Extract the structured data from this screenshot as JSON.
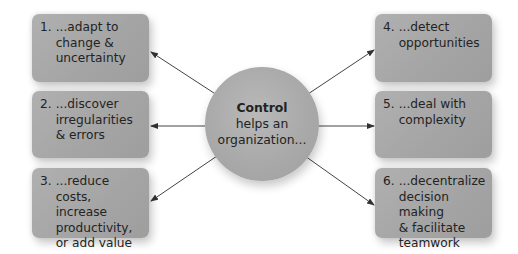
{
  "diagram": {
    "center": {
      "title": "Control",
      "line2": "helps an",
      "line3": "organization..."
    },
    "boxes": [
      {
        "num": "1.",
        "text": "...adapt to\nchange &\nuncertainty"
      },
      {
        "num": "2.",
        "text": "...discover\nirregularities\n& errors"
      },
      {
        "num": "3.",
        "text": "...reduce costs,\nincrease\nproductivity,\nor add value"
      },
      {
        "num": "4.",
        "text": "...detect\nopportunities"
      },
      {
        "num": "5.",
        "text": "...deal with\ncomplexity"
      },
      {
        "num": "6.",
        "text": "...decentralize\ndecision making\n& facilitate\nteamwork"
      }
    ],
    "colors": {
      "box_fill": "#a8a8a8",
      "circle_fill": "#aaaaaa",
      "text": "#232323",
      "arrow": "#333333"
    }
  }
}
